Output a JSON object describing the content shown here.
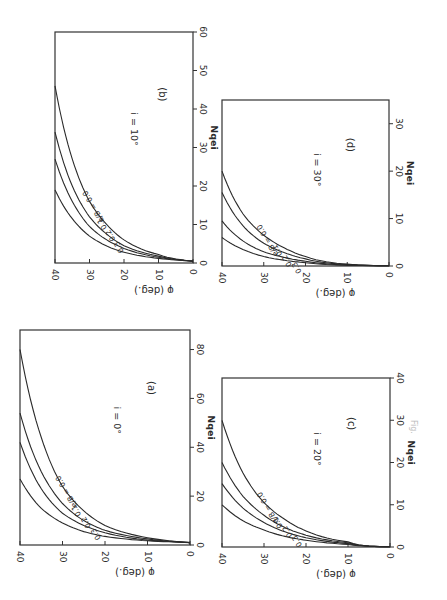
{
  "figure": {
    "orientation": "rotated 90 degrees clockwise on page",
    "caption": "Fig."
  },
  "chart_data": [
    {
      "id": "a",
      "type": "line",
      "panel_label": "(a)",
      "annotation": "i = 0°",
      "xlabel": "φ (deg.)",
      "ylabel": "Nqei",
      "xlim": [
        0,
        40
      ],
      "ylim": [
        0,
        88
      ],
      "xticks": [
        0,
        10,
        20,
        30,
        40
      ],
      "yticks": [
        0,
        20,
        40,
        60,
        80
      ],
      "legend_title": "e/B",
      "series": [
        {
          "name": "e/B = 0.0",
          "x": [
            0,
            10,
            20,
            25,
            30,
            35,
            40
          ],
          "values": [
            1,
            3,
            8,
            14,
            24,
            44,
            80
          ]
        },
        {
          "name": "0.1",
          "x": [
            0,
            10,
            20,
            25,
            30,
            35,
            40
          ],
          "values": [
            1,
            2.5,
            6,
            10,
            17,
            30,
            54
          ]
        },
        {
          "name": "0.2",
          "x": [
            0,
            10,
            20,
            25,
            30,
            35,
            40
          ],
          "values": [
            1,
            2,
            5,
            8,
            13,
            23,
            42
          ]
        },
        {
          "name": "0.3",
          "x": [
            0,
            10,
            20,
            25,
            30,
            35,
            40
          ],
          "values": [
            1,
            1.7,
            3.5,
            5.5,
            9,
            15,
            27
          ]
        }
      ],
      "grid": false
    },
    {
      "id": "b",
      "type": "line",
      "panel_label": "(b)",
      "annotation": "i = 10°",
      "xlabel": "φ (deg.)",
      "ylabel": "Nqei",
      "xlim": [
        0,
        40
      ],
      "ylim": [
        0,
        60
      ],
      "xticks": [
        0,
        10,
        20,
        30,
        40
      ],
      "yticks": [
        0,
        10,
        20,
        30,
        40,
        50,
        60
      ],
      "legend_title": "e/B",
      "series": [
        {
          "name": "e/B = 0.0",
          "x": [
            0,
            10,
            20,
            25,
            30,
            35,
            40
          ],
          "values": [
            0.5,
            2.2,
            6,
            10,
            16,
            27,
            46
          ]
        },
        {
          "name": "0.1",
          "x": [
            0,
            10,
            20,
            25,
            30,
            35,
            40
          ],
          "values": [
            0.5,
            1.8,
            4.5,
            7.5,
            12,
            20,
            34
          ]
        },
        {
          "name": "0.2",
          "x": [
            0,
            10,
            20,
            25,
            30,
            35,
            40
          ],
          "values": [
            0.5,
            1.5,
            3.8,
            6,
            9.5,
            16,
            27
          ]
        },
        {
          "name": "0.3",
          "x": [
            0,
            10,
            20,
            25,
            30,
            35,
            40
          ],
          "values": [
            0.5,
            1.2,
            2.8,
            4.4,
            7,
            11.5,
            19
          ]
        }
      ],
      "grid": false
    },
    {
      "id": "c",
      "type": "line",
      "panel_label": "(c)",
      "annotation": "i = 20°",
      "xlabel": "φ (deg.)",
      "ylabel": "Nqei",
      "xlim": [
        0,
        40
      ],
      "ylim": [
        0,
        40
      ],
      "xticks": [
        0,
        10,
        20,
        30,
        40
      ],
      "yticks": [
        0,
        10,
        20,
        30,
        40
      ],
      "legend_title": "e/B",
      "series": [
        {
          "name": "e/B = 0.0",
          "x": [
            0,
            10,
            20,
            25,
            30,
            35,
            40
          ],
          "values": [
            0,
            1.2,
            3.8,
            6.5,
            10.5,
            17.5,
            30
          ]
        },
        {
          "name": "0.1",
          "x": [
            0,
            10,
            20,
            25,
            30,
            35,
            40
          ],
          "values": [
            0,
            1,
            2.8,
            4.6,
            7.5,
            12,
            20
          ]
        },
        {
          "name": "0.2",
          "x": [
            0,
            10,
            20,
            25,
            30,
            35,
            40
          ],
          "values": [
            0,
            0.8,
            2.2,
            3.6,
            5.8,
            9.2,
            15
          ]
        },
        {
          "name": "0.3",
          "x": [
            0,
            10,
            20,
            25,
            30,
            35,
            40
          ],
          "values": [
            0,
            0.6,
            1.6,
            2.5,
            4,
            6.2,
            10
          ]
        }
      ],
      "grid": false
    },
    {
      "id": "d",
      "type": "line",
      "panel_label": "(d)",
      "annotation": "i = 30°",
      "xlabel": "φ (deg.)",
      "ylabel": "Nqei",
      "xlim": [
        0,
        40
      ],
      "ylim": [
        0,
        35
      ],
      "xticks": [
        0,
        10,
        20,
        30,
        40
      ],
      "yticks": [
        0,
        10,
        20,
        30
      ],
      "legend_title": "e/B",
      "series": [
        {
          "name": "e/B = 0.0",
          "x": [
            0,
            10,
            20,
            25,
            30,
            35,
            40
          ],
          "values": [
            0,
            0.4,
            2,
            3.8,
            6.5,
            11,
            20
          ]
        },
        {
          "name": "0.1",
          "x": [
            0,
            10,
            20,
            25,
            30,
            35,
            40
          ],
          "values": [
            0,
            0.3,
            1.5,
            2.8,
            4.8,
            8.5,
            15.5
          ]
        },
        {
          "name": "0.2",
          "x": [
            0,
            10,
            20,
            25,
            30,
            35,
            40
          ],
          "values": [
            0,
            0.2,
            1,
            1.8,
            3,
            5.3,
            9.5
          ]
        },
        {
          "name": "0.3",
          "x": [
            0,
            10,
            20,
            25,
            30,
            35,
            40
          ],
          "values": [
            0,
            0.15,
            0.7,
            1.2,
            2,
            3.5,
            6
          ]
        }
      ],
      "grid": false
    }
  ],
  "layout": {
    "panels": [
      {
        "id": "b",
        "left": 20,
        "top": 20,
        "plot_x0": 55,
        "plot_x1": 193,
        "plot_y_top": 32,
        "plot_y_bottom": 263
      },
      {
        "id": "d",
        "left": 210,
        "top": 90,
        "plot_x0": 222,
        "plot_x1": 389,
        "plot_y_top": 100,
        "plot_y_bottom": 266
      },
      {
        "id": "a",
        "left": 10,
        "top": 310,
        "plot_x0": 20,
        "plot_x1": 190,
        "plot_y_top": 330,
        "plot_y_bottom": 545
      },
      {
        "id": "c",
        "left": 210,
        "top": 370,
        "plot_x0": 222,
        "plot_x1": 390,
        "plot_y_top": 378,
        "plot_y_bottom": 547
      }
    ]
  }
}
